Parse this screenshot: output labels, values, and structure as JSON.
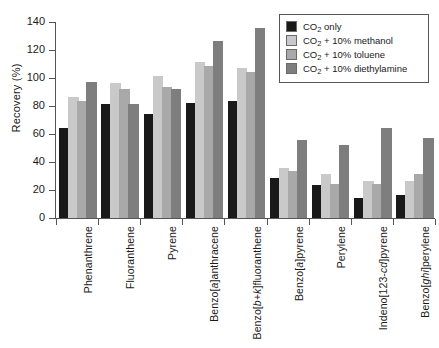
{
  "chart": {
    "ylabel": "Recovery (%)",
    "title": "",
    "legend_position": "top-right"
  },
  "legend": {
    "items": [
      {
        "label_prefix": "CO",
        "label_sub": "2",
        "label_suffix": " only",
        "color": "#191919",
        "name": "co2-only"
      },
      {
        "label_prefix": "CO",
        "label_sub": "2",
        "label_suffix": " + 10% methanol",
        "color": "#c9c9c9",
        "name": "co2-methanol"
      },
      {
        "label_prefix": "CO",
        "label_sub": "2",
        "label_suffix": " + 10% toluene",
        "color": "#a9a9a9",
        "name": "co2-toluene"
      },
      {
        "label_prefix": "CO",
        "label_sub": "2",
        "label_suffix": " + 10% diethylamine",
        "color": "#7e7e7e",
        "name": "co2-diethylamine"
      }
    ]
  },
  "yaxis": {
    "ticks": [
      "0",
      "20",
      "40",
      "60",
      "80",
      "100",
      "120",
      "140"
    ],
    "min": 0,
    "max": 140
  },
  "chart_data": {
    "type": "bar",
    "title": "",
    "xlabel": "",
    "ylabel": "Recovery (%)",
    "ylim": [
      0,
      140
    ],
    "grid": false,
    "legend_position": "upper right",
    "categories": [
      "Phenanthrene",
      "Fluoranthene",
      "Pyrene",
      "Benzo[a]anthracene",
      "Benzo[b+k]fluoranthene",
      "Benzo[a]pyrene",
      "Perylene",
      "Indeno[123-cd]pyrene",
      "Benzo[ghi]perylene"
    ],
    "series": [
      {
        "name": "CO2 only",
        "color": "#191919",
        "values": [
          63,
          80,
          73,
          81,
          82,
          27,
          22,
          13,
          15
        ]
      },
      {
        "name": "CO2 + 10% methanol",
        "color": "#c9c9c9",
        "values": [
          85,
          95,
          100,
          110,
          106,
          34,
          30,
          25,
          25
        ]
      },
      {
        "name": "CO2 + 10% toluene",
        "color": "#a9a9a9",
        "values": [
          82,
          91,
          92,
          107,
          103,
          32,
          23,
          23,
          30
        ]
      },
      {
        "name": "CO2 + 10% diethylamine",
        "color": "#7e7e7e",
        "values": [
          96,
          80,
          91,
          125,
          134,
          54,
          51,
          63,
          56
        ]
      }
    ]
  },
  "categories_rich": [
    {
      "parts": [
        {
          "t": "Phenanthrene",
          "i": false
        }
      ]
    },
    {
      "parts": [
        {
          "t": "Fluoranthene",
          "i": false
        }
      ]
    },
    {
      "parts": [
        {
          "t": "Pyrene",
          "i": false
        }
      ]
    },
    {
      "parts": [
        {
          "t": "Benzo[",
          "i": false
        },
        {
          "t": "a",
          "i": true
        },
        {
          "t": "]anthracene",
          "i": false
        }
      ]
    },
    {
      "parts": [
        {
          "t": "Benzo[",
          "i": false
        },
        {
          "t": "b+k",
          "i": true
        },
        {
          "t": "]fluoranthene",
          "i": false
        }
      ]
    },
    {
      "parts": [
        {
          "t": "Benzo[",
          "i": false
        },
        {
          "t": "a",
          "i": true
        },
        {
          "t": "]pyrene",
          "i": false
        }
      ]
    },
    {
      "parts": [
        {
          "t": "Perylene",
          "i": false
        }
      ]
    },
    {
      "parts": [
        {
          "t": "Indeno[123-",
          "i": false
        },
        {
          "t": "cd",
          "i": true
        },
        {
          "t": "]pyrene",
          "i": false
        }
      ]
    },
    {
      "parts": [
        {
          "t": "Benzo[",
          "i": false
        },
        {
          "t": "ghi",
          "i": true
        },
        {
          "t": "]perylene",
          "i": false
        }
      ]
    }
  ]
}
